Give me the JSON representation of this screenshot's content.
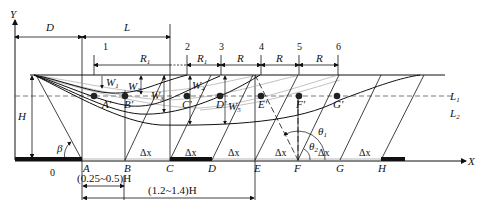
{
  "figure": {
    "type": "subsidence-diagram",
    "axes": {
      "x_label": "X",
      "y_label": "Y"
    },
    "top_dimensions": {
      "D": "D",
      "L": "L"
    },
    "section_numbers": [
      "1",
      "2",
      "3",
      "4",
      "5",
      "6"
    ],
    "spacings": [
      "R1",
      "R1",
      "R",
      "R",
      "R",
      "R"
    ],
    "spacing_labels": {
      "R1_main": "R",
      "R1_main_sub": "1",
      "R1_second": "R",
      "R1_second_sub": "1",
      "R": "R"
    },
    "subsidence_labels": [
      {
        "base": "W",
        "sub": "1"
      },
      {
        "base": "W",
        "sub": "2"
      },
      {
        "base": "W",
        "sub": "3"
      },
      {
        "base": "W",
        "sub": "4"
      },
      {
        "base": "W",
        "sub": "5"
      }
    ],
    "points_primed": [
      "A'",
      "B'",
      "C'",
      "D'",
      "E'",
      "F'",
      "G'"
    ],
    "ground_points": [
      "0",
      "A",
      "B",
      "C",
      "D",
      "E",
      "F",
      "G",
      "H"
    ],
    "delta_x": "Δx",
    "line_labels": {
      "L1": "L",
      "L1_sub": "1",
      "L2": "L",
      "L2_sub": "2"
    },
    "height_label": "H",
    "angles": {
      "beta": "β",
      "theta1": "θ",
      "theta1_sub": "1",
      "theta2": "θ",
      "theta2_sub": "2"
    },
    "bottom_dimensions": {
      "short": "(0.25~0.5)H",
      "long": "(1.2~1.4)H"
    }
  }
}
